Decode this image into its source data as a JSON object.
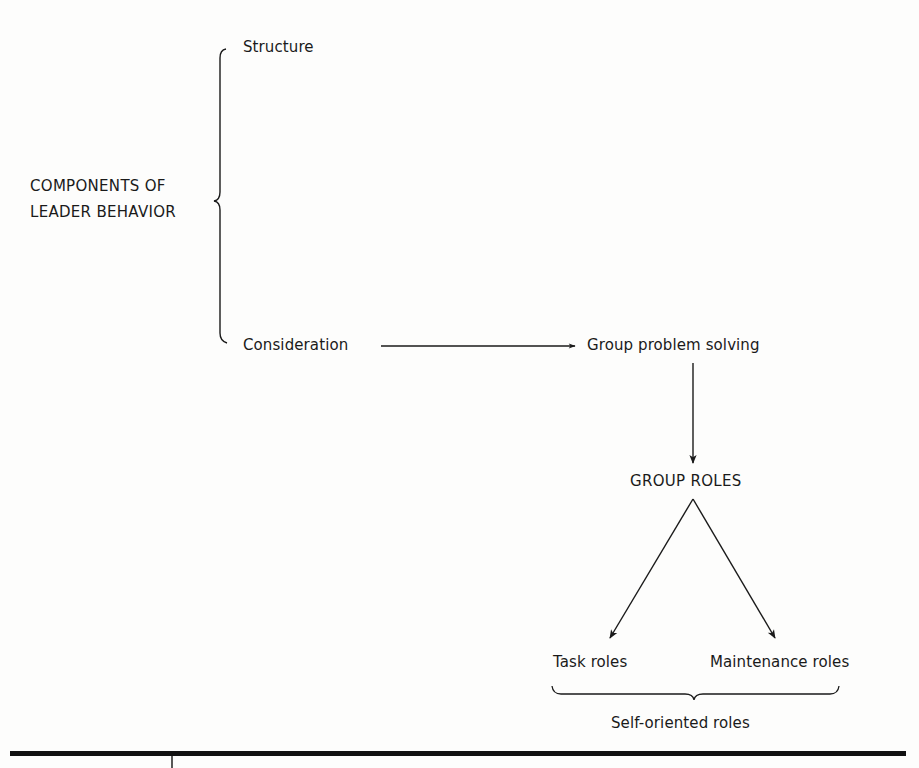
{
  "figure": {
    "root": {
      "line1": "COMPONENTS OF",
      "line2": "LEADER BEHAVIOR"
    },
    "components": [
      {
        "label": "Structure"
      },
      {
        "label": "Consideration"
      }
    ],
    "process": {
      "label": "Group problem solving"
    },
    "group_roles": {
      "label": "GROUP ROLES"
    },
    "role_types": [
      {
        "label": "Task roles"
      },
      {
        "label": "Maintenance roles"
      }
    ],
    "grouped_under": {
      "label": "Self-oriented roles"
    },
    "colors": {
      "ink": "#1a1a1a",
      "paper": "#fdfdfc"
    }
  }
}
